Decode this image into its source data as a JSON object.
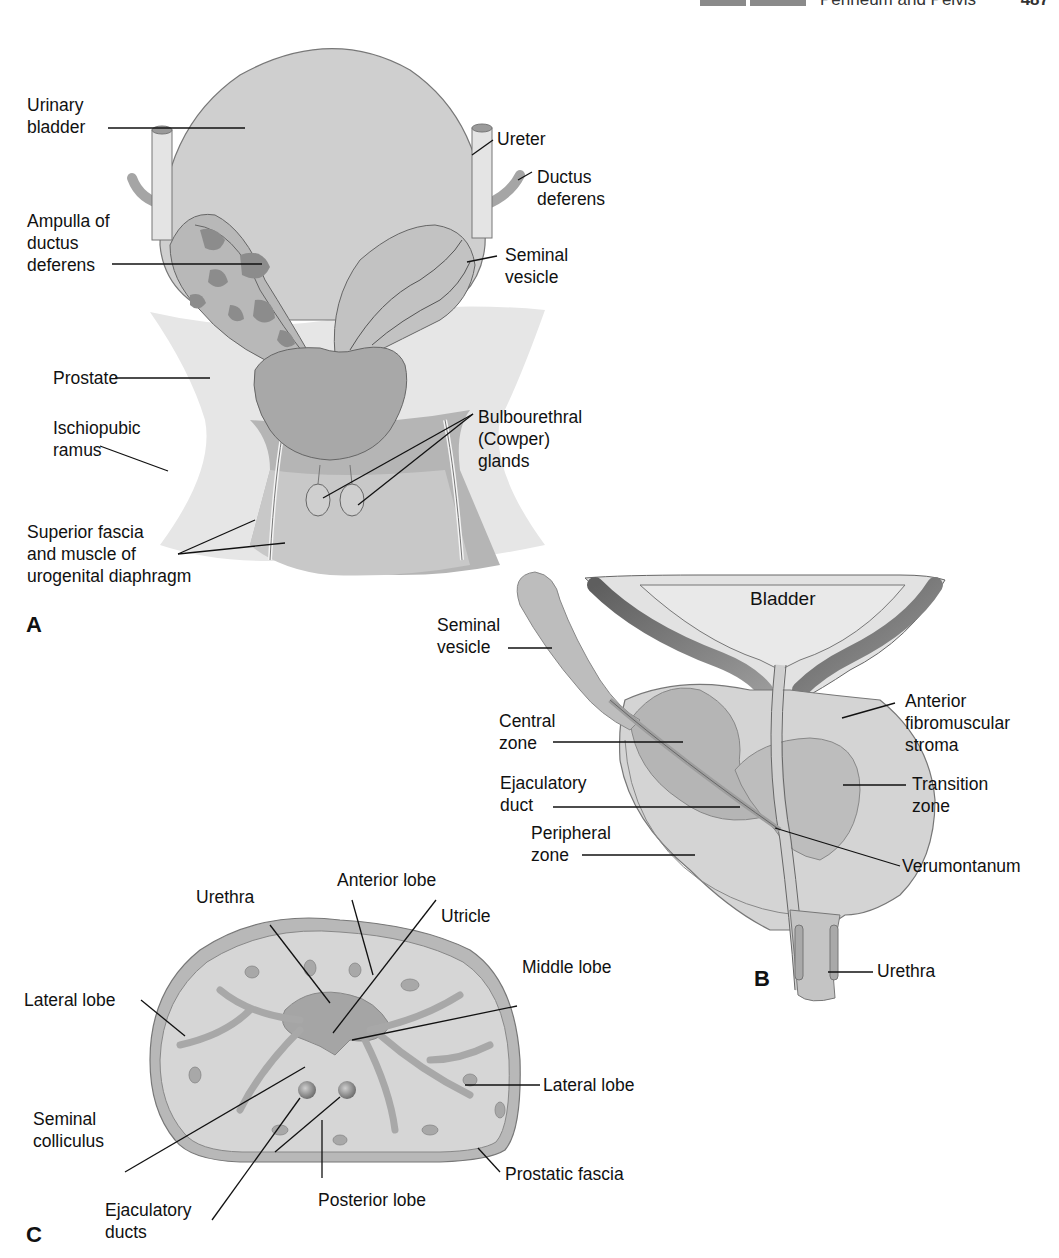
{
  "header": {
    "section_tags": [
      "",
      ""
    ],
    "title": "Perineum and Pelvis",
    "page_number": "487"
  },
  "panels": {
    "A": {
      "letter": "A",
      "labels": {
        "urinary_bladder": "Urinary\nbladder",
        "ureter": "Ureter",
        "ductus_deferens": "Ductus\ndeferens",
        "ampulla": "Ampulla of\nductus\ndeferens",
        "seminal_vesicle": "Seminal\nvesicle",
        "prostate": "Prostate",
        "ischiopubic_ramus": "Ischiopubic\nramus",
        "bulbourethral": "Bulbourethral\n(Cowper)\nglands",
        "superior_fascia": "Superior fascia\nand muscle of\nurogenital diaphragm"
      }
    },
    "B": {
      "letter": "B",
      "labels": {
        "bladder": "Bladder",
        "seminal_vesicle": "Seminal\nvesicle",
        "central_zone": "Central\nzone",
        "ejaculatory_duct": "Ejaculatory\nduct",
        "peripheral_zone": "Peripheral\nzone",
        "anterior_stroma": "Anterior\nfibromuscular\nstroma",
        "transition_zone": "Transition\nzone",
        "verumontanum": "Verumontanum",
        "urethra": "Urethra"
      }
    },
    "C": {
      "letter": "C",
      "labels": {
        "anterior_lobe": "Anterior lobe",
        "urethra": "Urethra",
        "utricle": "Utricle",
        "middle_lobe": "Middle lobe",
        "lateral_lobe_left": "Lateral lobe",
        "lateral_lobe_right": "Lateral lobe",
        "seminal_colliculus": "Seminal\ncolliculus",
        "ejaculatory_ducts": "Ejaculatory\nducts",
        "posterior_lobe": "Posterior lobe",
        "prostatic_fascia": "Prostatic fascia"
      }
    }
  },
  "colors": {
    "tissue_light": "#d9d9d9",
    "tissue_mid": "#bdbdbd",
    "tissue_dark": "#9a9a9a",
    "tissue_darker": "#7c7c7c",
    "outline": "#6e6e6e",
    "leader": "#111111"
  }
}
